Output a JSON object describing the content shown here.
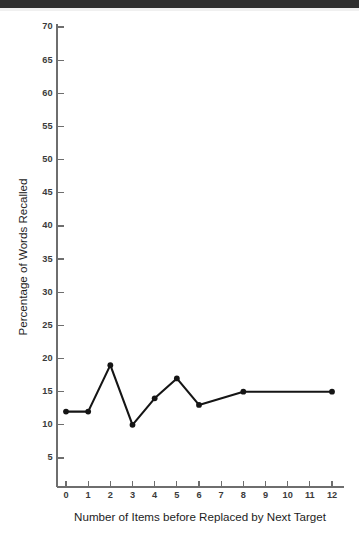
{
  "figure": {
    "background_color": "#ffffff",
    "scan_artifact_color": "#2f2f2f",
    "line_color": "#151515",
    "axis_color": "#6e6e6e",
    "label_color": "#3b3b3b"
  },
  "chart_data": {
    "type": "line",
    "title": "",
    "subtitle": "",
    "xlabel": "Number of Items before Replaced by Next Target",
    "ylabel": "Percentage of Words Recalled",
    "x": [
      0,
      1,
      2,
      3,
      4,
      5,
      6,
      8,
      12
    ],
    "values": [
      12,
      12,
      19,
      10,
      14,
      17,
      13,
      15,
      15
    ],
    "series": [
      {
        "name": "Percentage of Words Recalled",
        "x": [
          0,
          1,
          2,
          3,
          4,
          5,
          6,
          8,
          12
        ],
        "values": [
          12,
          12,
          19,
          10,
          14,
          17,
          13,
          15,
          15
        ],
        "marker": "filled-circle",
        "color": "#151515"
      }
    ],
    "xlim": [
      0,
      12
    ],
    "ylim": [
      0,
      70
    ],
    "xticks": [
      0,
      1,
      2,
      3,
      4,
      5,
      6,
      7,
      8,
      9,
      10,
      11,
      12
    ],
    "xtick_labels": [
      "0",
      "1",
      "2",
      "3",
      "4",
      "5",
      "6",
      "7",
      "8",
      "9",
      "10",
      "11",
      "12"
    ],
    "yticks": [
      5,
      10,
      15,
      20,
      25,
      30,
      35,
      40,
      45,
      50,
      55,
      60,
      65,
      70
    ],
    "ytick_labels": [
      "5",
      "10",
      "15",
      "20",
      "25",
      "30",
      "35",
      "40",
      "45",
      "50",
      "55",
      "60",
      "65",
      "70"
    ],
    "grid": false,
    "legend": false,
    "legend_position": "none",
    "annotations": []
  }
}
